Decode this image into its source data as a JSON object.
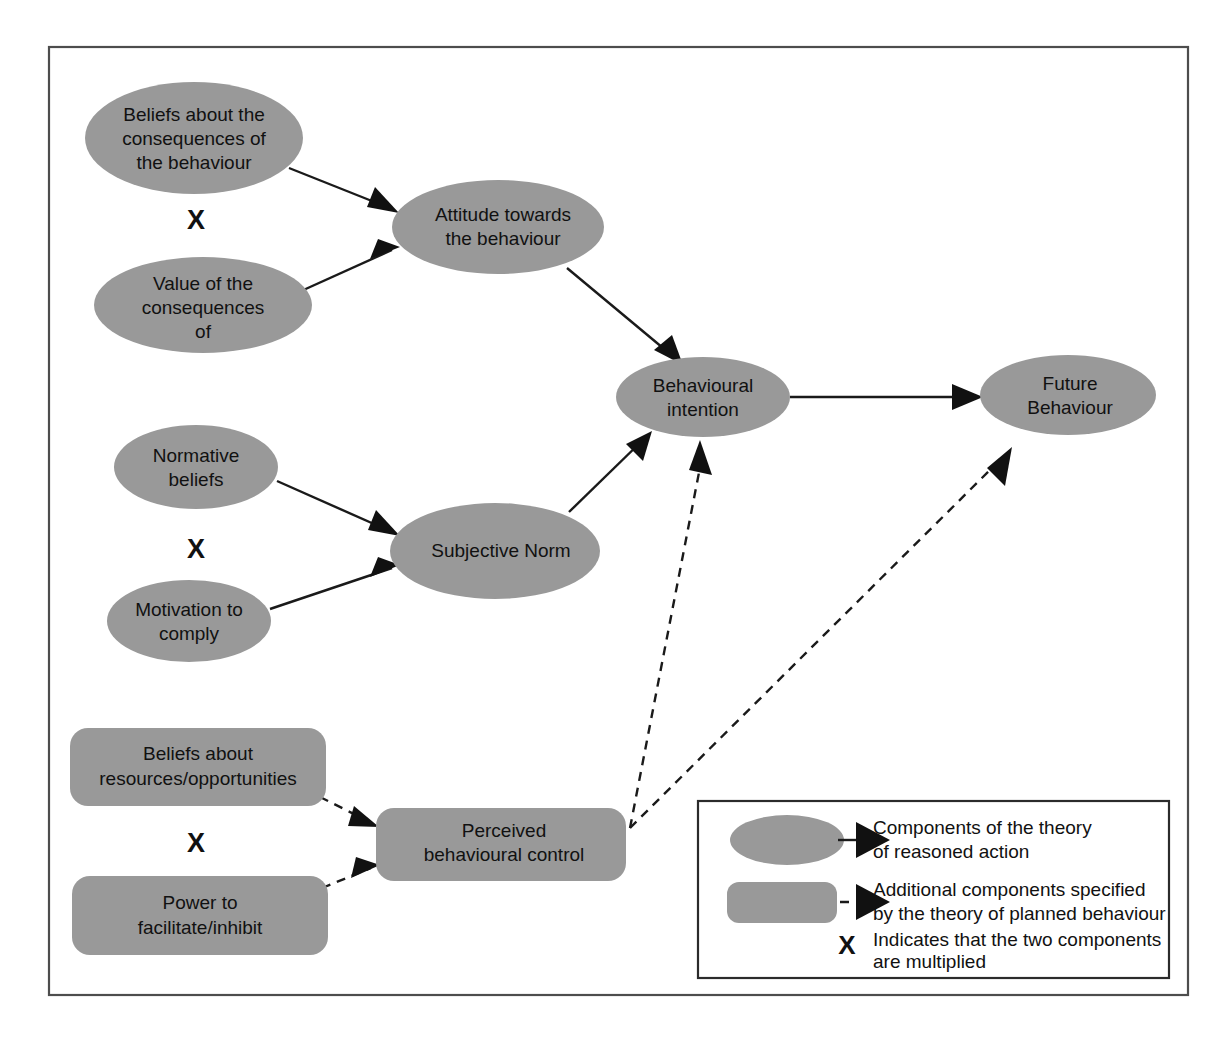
{
  "figure": {
    "kind": "conceptual-diagram",
    "frame_color": "#4d4d4d",
    "node_fill": "#999999",
    "edge_color": "#111111",
    "background": "#ffffff"
  },
  "nodes": {
    "beliefs_consequences": {
      "label": "Beliefs about the\nconsequences of\nthe behaviour",
      "line1": "Beliefs about the",
      "line2": "consequences of",
      "line3": "the behaviour",
      "shape": "ellipse",
      "group": "theory-of-reasoned-action"
    },
    "value_consequences": {
      "label": "Value of the\nconsequences\nof",
      "line1": "Value of the",
      "line2": "consequences",
      "line3": "of",
      "shape": "ellipse",
      "group": "theory-of-reasoned-action"
    },
    "attitude": {
      "label": "Attitude towards\nthe behaviour",
      "line1": "Attitude towards",
      "line2": "the behaviour",
      "shape": "ellipse",
      "group": "theory-of-reasoned-action"
    },
    "normative_beliefs": {
      "label": "Normative\nbeliefs",
      "line1": "Normative",
      "line2": "beliefs",
      "shape": "ellipse",
      "group": "theory-of-reasoned-action"
    },
    "motivation_comply": {
      "label": "Motivation to\ncomply",
      "line1": "Motivation to",
      "line2": "comply",
      "shape": "ellipse",
      "group": "theory-of-reasoned-action"
    },
    "subjective_norm": {
      "label": "Subjective Norm",
      "line1": "Subjective Norm",
      "shape": "ellipse",
      "group": "theory-of-reasoned-action"
    },
    "behavioural_intention": {
      "label": "Behavioural\nintention",
      "line1": "Behavioural",
      "line2": "intention",
      "shape": "ellipse",
      "group": "theory-of-reasoned-action"
    },
    "future_behaviour": {
      "label": "Future\nBehaviour",
      "line1": "Future",
      "line2": "Behaviour",
      "shape": "ellipse",
      "group": "theory-of-reasoned-action"
    },
    "beliefs_resources": {
      "label": "Beliefs about\nresources/opportunities",
      "line1": "Beliefs about",
      "line2": "resources/opportunities",
      "shape": "rounded-rect",
      "group": "theory-of-planned-behaviour"
    },
    "power_facilitate": {
      "label": "Power to\nfacilitate/inhibit",
      "line1": "Power to",
      "line2": "facilitate/inhibit",
      "shape": "rounded-rect",
      "group": "theory-of-planned-behaviour"
    },
    "perceived_control": {
      "label": "Perceived\nbehavioural control",
      "line1": "Perceived",
      "line2": "behavioural control",
      "shape": "rounded-rect",
      "group": "theory-of-planned-behaviour"
    }
  },
  "multipliers": {
    "symbol": "X",
    "attitude_pair": "X",
    "norm_pair": "X",
    "control_pair": "X"
  },
  "edges": [
    {
      "from": "beliefs_consequences",
      "to": "attitude",
      "style": "solid"
    },
    {
      "from": "value_consequences",
      "to": "attitude",
      "style": "solid"
    },
    {
      "from": "attitude",
      "to": "behavioural_intention",
      "style": "solid"
    },
    {
      "from": "normative_beliefs",
      "to": "subjective_norm",
      "style": "solid"
    },
    {
      "from": "motivation_comply",
      "to": "subjective_norm",
      "style": "solid"
    },
    {
      "from": "subjective_norm",
      "to": "behavioural_intention",
      "style": "solid"
    },
    {
      "from": "behavioural_intention",
      "to": "future_behaviour",
      "style": "solid"
    },
    {
      "from": "beliefs_resources",
      "to": "perceived_control",
      "style": "dashed"
    },
    {
      "from": "power_facilitate",
      "to": "perceived_control",
      "style": "dashed"
    },
    {
      "from": "perceived_control",
      "to": "behavioural_intention",
      "style": "dashed"
    },
    {
      "from": "perceived_control",
      "to": "future_behaviour",
      "style": "dashed"
    }
  ],
  "legend": {
    "items": [
      {
        "key": "reasoned-action",
        "swatch": "ellipse",
        "connector": "solid-arrow",
        "line1": "Components of the theory",
        "line2": "of reasoned action"
      },
      {
        "key": "planned-behaviour",
        "swatch": "rounded-rect",
        "connector": "dashed-arrow",
        "line1": "Additional components specified",
        "line2": "by the theory of planned behaviour"
      },
      {
        "key": "multiplier",
        "swatch": "x-symbol",
        "symbol": "X",
        "line1": "Indicates that the two components",
        "line2": "are multiplied"
      }
    ]
  }
}
